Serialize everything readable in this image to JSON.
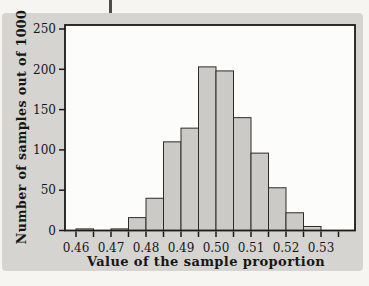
{
  "figure": {
    "page_color": "#f6f5f2",
    "panel_color": "#d5d4d0"
  },
  "chart_data": {
    "type": "bar",
    "subtype": "histogram",
    "title": "",
    "xlabel": "Value of the sample proportion",
    "ylabel": "Number of samples out of 1000",
    "bin_start": 0.46,
    "bin_width": 0.005,
    "values": [
      2,
      0,
      2,
      16,
      40,
      110,
      127,
      203,
      198,
      140,
      96,
      53,
      22,
      5
    ],
    "x_major_ticks": [
      {
        "v": 0.46,
        "label": "0.46"
      },
      {
        "v": 0.47,
        "label": "0.47"
      },
      {
        "v": 0.48,
        "label": "0.48"
      },
      {
        "v": 0.49,
        "label": "0.49"
      },
      {
        "v": 0.5,
        "label": "0.50"
      },
      {
        "v": 0.51,
        "label": "0.51"
      },
      {
        "v": 0.52,
        "label": "0.52"
      },
      {
        "v": 0.53,
        "label": "0.53"
      }
    ],
    "x_minor_ticks": [
      0.46,
      0.465,
      0.47,
      0.475,
      0.48,
      0.485,
      0.49,
      0.495,
      0.5,
      0.505,
      0.51,
      0.515,
      0.52,
      0.525,
      0.53,
      0.535
    ],
    "y_ticks": [
      {
        "v": 0,
        "label": "0"
      },
      {
        "v": 50,
        "label": "50"
      },
      {
        "v": 100,
        "label": "100"
      },
      {
        "v": 150,
        "label": "150"
      },
      {
        "v": 200,
        "label": "200"
      },
      {
        "v": 250,
        "label": "250"
      }
    ],
    "xlim": [
      0.4569,
      0.5399
    ],
    "ylim": [
      0,
      253
    ],
    "grid": false,
    "legend": null,
    "colors": {
      "plot_bg": "#fcfcfa",
      "bar_fill": "#cbcac6",
      "bar_stroke": "#2c2c2a",
      "axis": "#1a1a18"
    }
  }
}
